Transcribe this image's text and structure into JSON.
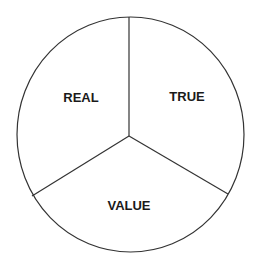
{
  "diagram": {
    "type": "pie-partition",
    "sectors": [
      {
        "label": "REAL"
      },
      {
        "label": "TRUE"
      },
      {
        "label": "VALUE"
      }
    ],
    "colors": {
      "stroke": "#333333",
      "text": "#1a1a1a",
      "background": "#ffffff"
    }
  }
}
